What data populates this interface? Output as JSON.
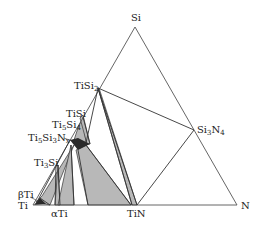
{
  "diagram": {
    "type": "ternary-phase-diagram",
    "colors": {
      "line": "#333333",
      "shade": "#b8b8b8",
      "dark": "#2a2a2a",
      "bg": "#ffffff"
    },
    "vertices": {
      "Si": {
        "label": "Si"
      },
      "Ti": {
        "label": "Ti"
      },
      "N": {
        "label": "N"
      }
    },
    "phases": [
      {
        "id": "TiSi2",
        "base": "TiSi",
        "sub": "2"
      },
      {
        "id": "TiSi",
        "base": "TiSi",
        "sub": ""
      },
      {
        "id": "Ti5Si4",
        "base": "Ti",
        "sub": "5",
        "base2": "Si",
        "sub2": "4"
      },
      {
        "id": "Ti5Si3Nx",
        "base": "Ti",
        "sub": "5",
        "base2": "Si",
        "sub2": "3",
        "base3": "N",
        "sub3": "x"
      },
      {
        "id": "Ti3Si",
        "base": "Ti",
        "sub": "3",
        "base2": "Si"
      },
      {
        "id": "betaTi",
        "label": "βTi"
      },
      {
        "id": "alphaTi",
        "label": "αTi"
      },
      {
        "id": "TiN",
        "label": "TiN"
      },
      {
        "id": "Si3N4",
        "base": "Si",
        "sub": "3",
        "base2": "N",
        "sub2": "4"
      }
    ]
  }
}
